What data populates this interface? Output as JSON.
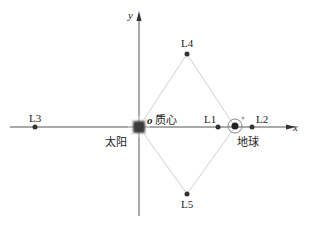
{
  "diagram": {
    "title": "",
    "axes": {
      "x_label": "x",
      "y_label": "y",
      "origin_label": "o"
    },
    "bodies": [
      {
        "id": "sun",
        "label": "太阳"
      },
      {
        "id": "barycenter",
        "label": "质心"
      },
      {
        "id": "earth",
        "label": "地球"
      }
    ],
    "lagrange_points": [
      {
        "id": "L1",
        "label": "L1"
      },
      {
        "id": "L2",
        "label": "L2"
      },
      {
        "id": "L3",
        "label": "L3"
      },
      {
        "id": "L4",
        "label": "L4"
      },
      {
        "id": "L5",
        "label": "L5"
      }
    ],
    "colors": {
      "axis": "#444444",
      "triangle": "#c8c8c8",
      "point": "#333333",
      "sun": "#333333",
      "earth_ring": "#777777"
    }
  }
}
